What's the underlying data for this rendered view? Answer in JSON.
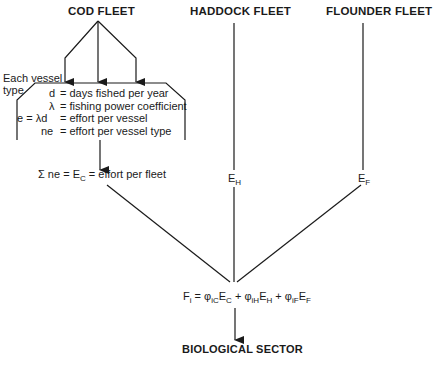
{
  "fleets": {
    "cod": "COD FLEET",
    "haddock": "HADDOCK FLEET",
    "flounder": "FLOUNDER FLEET"
  },
  "vessel_label": [
    "Each vessel",
    "type"
  ],
  "definitions": [
    {
      "lhs": "d",
      "rhs": "= days fished per year"
    },
    {
      "lhs": "λ",
      "rhs": "= fishing power coefficient"
    },
    {
      "lhs": "e = λd",
      "rhs": "= effort per vessel"
    },
    {
      "lhs": "ne",
      "rhs": "= effort per vessel type"
    }
  ],
  "sum_equation": {
    "prefix": "Σ ne = E",
    "sub": "C",
    "suffix": " = effort per fleet"
  },
  "haddock_effort": {
    "base": "E",
    "sub": "H"
  },
  "flounder_effort": {
    "base": "E",
    "sub": "F"
  },
  "mortality_equation": {
    "F": "F",
    "F_sub": "i",
    "eq": " = ",
    "phi1": "φ",
    "phi1_sub": "iC",
    "E1": "E",
    "E1_sub": "C",
    "plus1": " + ",
    "phi2": "φ",
    "phi2_sub": "iH",
    "E2": "E",
    "E2_sub": "H",
    "plus2": " + ",
    "phi3": "φ",
    "phi3_sub": "iF",
    "E3": "E",
    "E3_sub": "F"
  },
  "output": "BIOLOGICAL SECTOR"
}
